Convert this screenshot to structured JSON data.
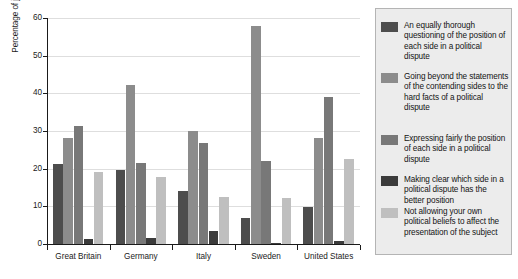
{
  "chart_data": {
    "type": "bar",
    "title": "",
    "xlabel": "",
    "ylabel": "Percentage of journalists responding",
    "ylim": [
      0,
      60
    ],
    "yticks": [
      0,
      10,
      20,
      30,
      40,
      50,
      60
    ],
    "grid": true,
    "legend_position": "right",
    "categories": [
      "Great Britain",
      "Germany",
      "Italy",
      "Sweden",
      "United States"
    ],
    "series": [
      {
        "name": "An equally thorough questioning of the position of each side in a political dispute",
        "color": "#4d4d4d",
        "values": [
          21.3,
          19.6,
          14.1,
          6.9,
          9.9
        ]
      },
      {
        "name": "Going beyond the statements of the contending sides to the hard facts of a political dispute",
        "color": "#8c8c8c",
        "values": [
          28.2,
          42.2,
          30.0,
          58.0,
          28.2
        ]
      },
      {
        "name": "Expressing fairly the position of each side in a political dispute",
        "color": "#787878",
        "values": [
          31.2,
          21.6,
          26.8,
          22.0,
          39.1
        ]
      },
      {
        "name": "Making clear which side in a political dispute has the better position",
        "color": "#3b3b3b",
        "values": [
          1.3,
          1.6,
          3.5,
          0.4,
          0.9
        ]
      },
      {
        "name": "Not allowing your own political beliefs to affect the presentation of the subject",
        "color": "#bfbfbf",
        "values": [
          19.0,
          17.8,
          12.6,
          12.2,
          22.5
        ]
      }
    ]
  },
  "legend": {
    "items": [
      {
        "label": "An equally thorough questioning of the position of each side in a political dispute",
        "color": "#4d4d4d"
      },
      {
        "label": "Going beyond the statements of the contending sides to the hard facts of a political dispute",
        "color": "#8c8c8c"
      },
      {
        "label": "Expressing fairly the position of each side in a political dispute",
        "color": "#787878"
      },
      {
        "label": "Making clear which side in a political dispute has the better position",
        "color": "#3b3b3b"
      },
      {
        "label": "Not allowing your own political beliefs to affect the presentation of the subject",
        "color": "#bfbfbf"
      }
    ]
  },
  "axes": {
    "y_title": "Percentage of journalists responding",
    "y_tick_labels": [
      "0",
      "10",
      "20",
      "30",
      "40",
      "50",
      "60"
    ],
    "x_tick_labels": [
      "Great Britain",
      "Germany",
      "Italy",
      "Sweden",
      "United States"
    ]
  }
}
